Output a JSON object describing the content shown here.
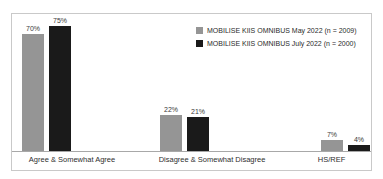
{
  "top_sliver_text": "",
  "colors": {
    "series_0": "#959595",
    "series_1": "#1a1a1a",
    "frame_border": "#c9c9c9",
    "axis_line": "#a8a8a8",
    "background": "#ffffff",
    "label_text": "#2e2e2e"
  },
  "legend": {
    "position": "top-right",
    "entries": [
      {
        "label": "MOBILISE KIIS OMNIBUS May 2022 (n = 2009)",
        "swatch": "legend-swatch-may"
      },
      {
        "label": "MOBILISE KIIS OMNIBUS July 2022 (n = 2000)",
        "swatch": "legend-swatch-july"
      }
    ]
  },
  "chart_data": {
    "type": "bar",
    "title": "",
    "xlabel": "",
    "ylabel": "",
    "ylim": [
      0,
      80
    ],
    "grid": false,
    "legend_position": "top-right",
    "categories": [
      "Agree & Somewhat Agree",
      "Disagree & Somewhat Disagree",
      "HS/REF"
    ],
    "series": [
      {
        "name": "MOBILISE KIIS OMNIBUS May 2022 (n = 2009)",
        "color": "#959595",
        "values": [
          70,
          22,
          7
        ],
        "value_labels": [
          "70%",
          "22%",
          "7%"
        ]
      },
      {
        "name": "MOBILISE KIIS OMNIBUS July 2022 (n = 2000)",
        "color": "#1a1a1a",
        "values": [
          75,
          21,
          4
        ],
        "value_labels": [
          "75%",
          "21%",
          "4%"
        ]
      }
    ]
  }
}
